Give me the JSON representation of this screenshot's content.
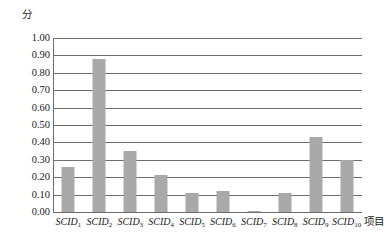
{
  "chart_data": {
    "type": "bar",
    "title": "",
    "subtitle": "",
    "xlabel": "项目",
    "ylabel": "分",
    "categories": [
      "SCID1",
      "SCID2",
      "SCID3",
      "SCID4",
      "SCID5",
      "SCID6",
      "SCID7",
      "SCID8",
      "SCID9",
      "SCID10"
    ],
    "category_labels": [
      {
        "base": "SCID",
        "sub": "1"
      },
      {
        "base": "SCID",
        "sub": "2"
      },
      {
        "base": "SCID",
        "sub": "3"
      },
      {
        "base": "SCID",
        "sub": "4"
      },
      {
        "base": "SCID",
        "sub": "5"
      },
      {
        "base": "SCID",
        "sub": "6"
      },
      {
        "base": "SCID",
        "sub": "7"
      },
      {
        "base": "SCID",
        "sub": "8"
      },
      {
        "base": "SCID",
        "sub": "9"
      },
      {
        "base": "SCID",
        "sub": "10"
      }
    ],
    "values": [
      0.26,
      0.88,
      0.35,
      0.21,
      0.11,
      0.12,
      0.005,
      0.11,
      0.43,
      0.3
    ],
    "ylim": [
      0.0,
      1.0
    ],
    "ytick_step": 0.1,
    "ytick_labels": [
      "1.00",
      "0.90",
      "0.80",
      "0.70",
      "0.60",
      "0.50",
      "0.40",
      "0.30",
      "0.20",
      "0.10",
      "0.00"
    ],
    "ytick_values": [
      1.0,
      0.9,
      0.8,
      0.7,
      0.6,
      0.5,
      0.4,
      0.3,
      0.2,
      0.1,
      0.0
    ],
    "grid": true,
    "grid_axis": "y",
    "legend": false,
    "legend_position": "none",
    "bar_color": "#a9a9a9",
    "grid_color": "#6e6e6e",
    "axis_color": "#6e6e6e",
    "background_color": "#ffffff"
  }
}
